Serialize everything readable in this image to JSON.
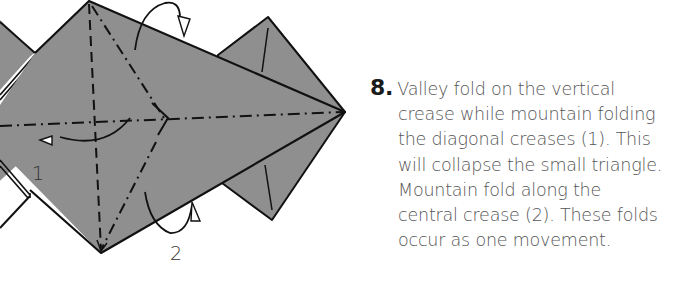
{
  "step": {
    "number": "8.",
    "lines": [
      "Valley fold on the vertical",
      "crease while mountain folding",
      "the diagonal creases (1). This",
      "will collapse the small triangle.",
      "Mountain fold along the",
      "central crease (2). These folds",
      "occur as one movement."
    ]
  },
  "diagram": {
    "labels": {
      "fold1": "1",
      "fold2": "2"
    },
    "colors": {
      "paper_fill": "#8f8f8f",
      "line": "#111111",
      "text": "#555555"
    }
  }
}
